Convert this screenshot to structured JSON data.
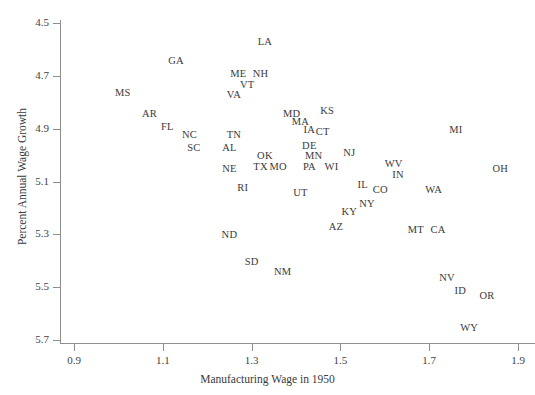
{
  "top_caption": "",
  "axes": {
    "xlabel": "Manufacturing Wage in 1950",
    "ylabel": "Percent Annual Wage Growth",
    "xticks": [
      "0.9",
      "1.1",
      "1.3",
      "1.5",
      "1.7",
      "1.9"
    ],
    "yticks": [
      "5.7",
      "5.5",
      "5.3",
      "5.1",
      "4.9",
      "4.7",
      "4.5"
    ]
  },
  "chart_data": {
    "type": "scatter",
    "title": "",
    "xlabel": "Manufacturing Wage in 1950",
    "ylabel": "Percent Annual Wage Growth",
    "xlim": [
      0.87,
      1.93
    ],
    "ylim": [
      4.44,
      5.73
    ],
    "xticks": [
      0.9,
      1.1,
      1.3,
      1.5,
      1.7,
      1.9
    ],
    "yticks": [
      4.5,
      4.7,
      4.9,
      5.1,
      5.3,
      5.5,
      5.7
    ],
    "grid": false,
    "legend": null,
    "marker": "text-label",
    "labels_are_markers": true,
    "points": [
      {
        "label": "MS",
        "x": 1.01,
        "y": 5.44
      },
      {
        "label": "GA",
        "x": 1.13,
        "y": 5.56
      },
      {
        "label": "AR",
        "x": 1.07,
        "y": 5.36
      },
      {
        "label": "FL",
        "x": 1.11,
        "y": 5.31
      },
      {
        "label": "NC",
        "x": 1.16,
        "y": 5.28
      },
      {
        "label": "SC",
        "x": 1.17,
        "y": 5.23
      },
      {
        "label": "TN",
        "x": 1.26,
        "y": 5.28
      },
      {
        "label": "AL",
        "x": 1.25,
        "y": 5.23
      },
      {
        "label": "LA",
        "x": 1.33,
        "y": 5.63
      },
      {
        "label": "ME",
        "x": 1.27,
        "y": 5.51
      },
      {
        "label": "NH",
        "x": 1.32,
        "y": 5.51
      },
      {
        "label": "VT",
        "x": 1.29,
        "y": 5.47
      },
      {
        "label": "VA",
        "x": 1.26,
        "y": 5.43
      },
      {
        "label": "MD",
        "x": 1.39,
        "y": 5.36
      },
      {
        "label": "KS",
        "x": 1.47,
        "y": 5.37
      },
      {
        "label": "MA",
        "x": 1.41,
        "y": 5.33
      },
      {
        "label": "IA",
        "x": 1.43,
        "y": 5.3
      },
      {
        "label": "CT",
        "x": 1.46,
        "y": 5.29
      },
      {
        "label": "DE",
        "x": 1.43,
        "y": 5.24
      },
      {
        "label": "MN",
        "x": 1.44,
        "y": 5.2
      },
      {
        "label": "NJ",
        "x": 1.52,
        "y": 5.21
      },
      {
        "label": "OK",
        "x": 1.33,
        "y": 5.2
      },
      {
        "label": "TX",
        "x": 1.32,
        "y": 5.16
      },
      {
        "label": "MO",
        "x": 1.36,
        "y": 5.16
      },
      {
        "label": "PA",
        "x": 1.43,
        "y": 5.16
      },
      {
        "label": "WI",
        "x": 1.48,
        "y": 5.16
      },
      {
        "label": "WV",
        "x": 1.62,
        "y": 5.17
      },
      {
        "label": "IN",
        "x": 1.63,
        "y": 5.13
      },
      {
        "label": "NE",
        "x": 1.25,
        "y": 5.15
      },
      {
        "label": "RI",
        "x": 1.28,
        "y": 5.08
      },
      {
        "label": "UT",
        "x": 1.41,
        "y": 5.06
      },
      {
        "label": "IL",
        "x": 1.55,
        "y": 5.09
      },
      {
        "label": "CO",
        "x": 1.59,
        "y": 5.07
      },
      {
        "label": "MI",
        "x": 1.76,
        "y": 5.3
      },
      {
        "label": "OH",
        "x": 1.86,
        "y": 5.15
      },
      {
        "label": "WA",
        "x": 1.71,
        "y": 5.07
      },
      {
        "label": "NY",
        "x": 1.56,
        "y": 5.02
      },
      {
        "label": "KY",
        "x": 1.52,
        "y": 4.99
      },
      {
        "label": "AZ",
        "x": 1.49,
        "y": 4.93
      },
      {
        "label": "ND",
        "x": 1.25,
        "y": 4.9
      },
      {
        "label": "MT",
        "x": 1.67,
        "y": 4.92
      },
      {
        "label": "CA",
        "x": 1.72,
        "y": 4.92
      },
      {
        "label": "SD",
        "x": 1.3,
        "y": 4.8
      },
      {
        "label": "NM",
        "x": 1.37,
        "y": 4.76
      },
      {
        "label": "NV",
        "x": 1.74,
        "y": 4.74
      },
      {
        "label": "ID",
        "x": 1.77,
        "y": 4.69
      },
      {
        "label": "OR",
        "x": 1.83,
        "y": 4.67
      },
      {
        "label": "WY",
        "x": 1.79,
        "y": 4.55
      }
    ]
  }
}
